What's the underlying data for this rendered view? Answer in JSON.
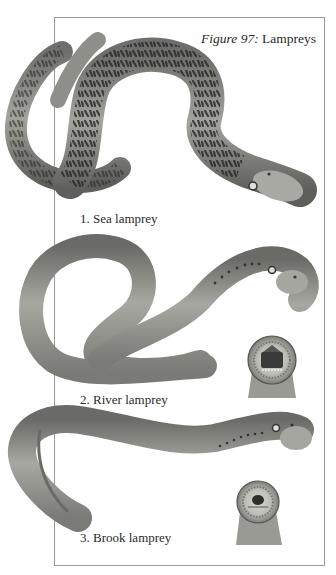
{
  "figure": {
    "number_label": "Figure 97:",
    "title": "Lampreys"
  },
  "specimens": [
    {
      "label": "1. Sea lamprey",
      "icon": "sea-lamprey-illustration"
    },
    {
      "label": "2. River lamprey",
      "icon": "river-lamprey-illustration",
      "detail_icon": "oral-disc-illustration"
    },
    {
      "label": "3. Brook lamprey",
      "icon": "brook-lamprey-illustration",
      "detail_icon": "oral-disc-illustration"
    }
  ],
  "colors": {
    "frame": "#9a9a9a",
    "text": "#2a2a2a",
    "sea_body": "#8a8a84",
    "sea_mottle": "#2b2b2b",
    "river_body": "#8e8e8a",
    "brook_body": "#8c8c88"
  }
}
